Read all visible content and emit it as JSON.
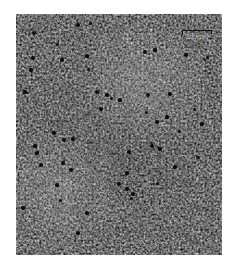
{
  "figure": {
    "type": "transmission-electron-micrograph",
    "modality": "immunogold-labelled thin section",
    "background_color": "#ffffff"
  },
  "panel": {
    "x": 16,
    "y": 14,
    "width": 206,
    "height": 241,
    "base_gray": "#b4b4b4",
    "dark_gray": "#6e6e6e",
    "light_gray": "#f2f2f2"
  },
  "scale_bar": {
    "label": "0.1 µm",
    "value": 0.1,
    "unit": "µm",
    "color": "#111111",
    "x": 182,
    "y": 30,
    "length": 30,
    "tick_height": 4
  },
  "texture": {
    "grain_base_frequency": 0.46,
    "grain_octaves": 4,
    "grain_seed": 17,
    "blur": 0.55,
    "contrast_slope": 1.45,
    "contrast_intercept": -0.22
  },
  "particles": {
    "label": "gold-particle",
    "color": "#0d0d0d",
    "count": 52,
    "items": [
      {
        "x": 34,
        "y": 33,
        "d": 4.0
      },
      {
        "x": 78,
        "y": 25,
        "d": 3.4
      },
      {
        "x": 90,
        "y": 23,
        "d": 3.0
      },
      {
        "x": 145,
        "y": 52,
        "d": 3.8
      },
      {
        "x": 155,
        "y": 50,
        "d": 3.2
      },
      {
        "x": 62,
        "y": 60,
        "d": 3.6
      },
      {
        "x": 87,
        "y": 56,
        "d": 3.2
      },
      {
        "x": 57,
        "y": 44,
        "d": 3.0
      },
      {
        "x": 33,
        "y": 58,
        "d": 3.4
      },
      {
        "x": 31,
        "y": 70,
        "d": 3.2
      },
      {
        "x": 88,
        "y": 69,
        "d": 3.0
      },
      {
        "x": 186,
        "y": 55,
        "d": 3.4
      },
      {
        "x": 207,
        "y": 57,
        "d": 3.0
      },
      {
        "x": 148,
        "y": 95,
        "d": 4.2
      },
      {
        "x": 170,
        "y": 94,
        "d": 3.4
      },
      {
        "x": 205,
        "y": 60,
        "d": 2.8
      },
      {
        "x": 25,
        "y": 92,
        "d": 3.4
      },
      {
        "x": 97,
        "y": 92,
        "d": 4.0
      },
      {
        "x": 107,
        "y": 95,
        "d": 3.4
      },
      {
        "x": 111,
        "y": 98,
        "d": 3.0
      },
      {
        "x": 120,
        "y": 100,
        "d": 3.2
      },
      {
        "x": 101,
        "y": 109,
        "d": 3.6
      },
      {
        "x": 146,
        "y": 112,
        "d": 3.0
      },
      {
        "x": 167,
        "y": 117,
        "d": 3.2
      },
      {
        "x": 157,
        "y": 122,
        "d": 3.6
      },
      {
        "x": 179,
        "y": 131,
        "d": 3.0
      },
      {
        "x": 194,
        "y": 109,
        "d": 3.0
      },
      {
        "x": 202,
        "y": 124,
        "d": 3.2
      },
      {
        "x": 54,
        "y": 133,
        "d": 3.4
      },
      {
        "x": 64,
        "y": 140,
        "d": 4.2
      },
      {
        "x": 73,
        "y": 139,
        "d": 3.4
      },
      {
        "x": 35,
        "y": 146,
        "d": 3.6
      },
      {
        "x": 37,
        "y": 153,
        "d": 3.2
      },
      {
        "x": 152,
        "y": 146,
        "d": 4.0
      },
      {
        "x": 160,
        "y": 149,
        "d": 3.2
      },
      {
        "x": 129,
        "y": 152,
        "d": 3.4
      },
      {
        "x": 41,
        "y": 165,
        "d": 3.6
      },
      {
        "x": 63,
        "y": 163,
        "d": 3.2
      },
      {
        "x": 71,
        "y": 170,
        "d": 4.2
      },
      {
        "x": 127,
        "y": 173,
        "d": 3.2
      },
      {
        "x": 175,
        "y": 167,
        "d": 3.4
      },
      {
        "x": 198,
        "y": 157,
        "d": 3.0
      },
      {
        "x": 57,
        "y": 185,
        "d": 3.2
      },
      {
        "x": 119,
        "y": 184,
        "d": 4.0
      },
      {
        "x": 127,
        "y": 189,
        "d": 3.6
      },
      {
        "x": 133,
        "y": 194,
        "d": 3.2
      },
      {
        "x": 157,
        "y": 183,
        "d": 3.0
      },
      {
        "x": 23,
        "y": 208,
        "d": 3.4
      },
      {
        "x": 60,
        "y": 200,
        "d": 3.0
      },
      {
        "x": 87,
        "y": 213,
        "d": 3.4
      },
      {
        "x": 131,
        "y": 198,
        "d": 3.0
      },
      {
        "x": 78,
        "y": 233,
        "d": 3.2
      }
    ]
  }
}
